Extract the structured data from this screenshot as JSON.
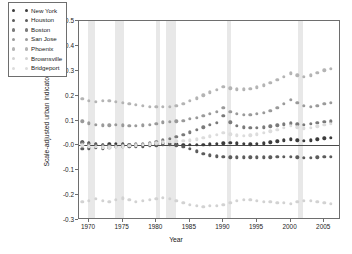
{
  "figure_tag": "FIG. 51",
  "chart_data": {
    "type": "scatter",
    "title": "",
    "xlabel": "Year",
    "ylabel": "Scale-adjusted urban indicators",
    "xlim": [
      1968.5,
      2007.5
    ],
    "ylim": [
      -0.3,
      0.5
    ],
    "xticks": [
      1970,
      1975,
      1980,
      1985,
      1990,
      1995,
      2000,
      2005
    ],
    "yticks": [
      -0.3,
      -0.2,
      -0.1,
      -0.0,
      0.1,
      0.2,
      0.3,
      0.4,
      0.5
    ],
    "ytick_labels": [
      "-0.3",
      "-0.2",
      "-0.1",
      "-0.0",
      "0.1",
      "0.2",
      "0.3",
      "0.4",
      "0.5"
    ],
    "grid": false,
    "legend_position": "upper-left",
    "zero_reference_line": 0.0,
    "shaded_bands": [
      {
        "start": 1969.9,
        "end": 1970.9
      },
      {
        "start": 1973.9,
        "end": 1975.2
      },
      {
        "start": 1980.0,
        "end": 1980.6
      },
      {
        "start": 1981.5,
        "end": 1982.9
      },
      {
        "start": 1990.5,
        "end": 1991.2
      },
      {
        "start": 2001.1,
        "end": 2001.9
      }
    ],
    "x": [
      1969,
      1970,
      1971,
      1972,
      1973,
      1974,
      1975,
      1976,
      1977,
      1978,
      1979,
      1980,
      1981,
      1982,
      1983,
      1984,
      1985,
      1986,
      1987,
      1988,
      1989,
      1990,
      1991,
      1992,
      1993,
      1994,
      1995,
      1996,
      1997,
      1998,
      1999,
      2000,
      2001,
      2002,
      2003,
      2004,
      2005,
      2006
    ],
    "series": [
      {
        "name": "New York",
        "color": "#3c3c3c",
        "values": [
          0.013,
          0.008,
          0.005,
          0.003,
          0.004,
          0.006,
          0.004,
          0.002,
          0.001,
          0.002,
          0.004,
          0.006,
          0.008,
          0.006,
          0.004,
          0.003,
          0.002,
          0.002,
          0.003,
          0.004,
          0.006,
          0.008,
          0.01,
          0.008,
          0.006,
          0.005,
          0.006,
          0.008,
          0.012,
          0.016,
          0.02,
          0.024,
          0.021,
          0.018,
          0.02,
          0.024,
          0.028,
          0.03
        ]
      },
      {
        "name": "Houston",
        "color": "#5c5c5c",
        "values": [
          -0.015,
          -0.012,
          -0.01,
          -0.012,
          -0.009,
          -0.006,
          -0.004,
          -0.004,
          -0.005,
          -0.004,
          -0.002,
          0.0,
          0.004,
          0.004,
          0.0,
          -0.006,
          -0.014,
          -0.024,
          -0.034,
          -0.04,
          -0.044,
          -0.046,
          -0.048,
          -0.048,
          -0.048,
          -0.048,
          -0.048,
          -0.048,
          -0.048,
          -0.047,
          -0.046,
          -0.046,
          -0.048,
          -0.049,
          -0.049,
          -0.048,
          -0.047,
          -0.046
        ]
      },
      {
        "name": "Boston",
        "color": "#7a7a7a",
        "values": [
          0.01,
          0.006,
          0.003,
          0.0,
          -0.002,
          -0.002,
          0.0,
          0.002,
          0.004,
          0.006,
          0.01,
          0.014,
          0.02,
          0.026,
          0.034,
          0.042,
          0.052,
          0.062,
          0.072,
          0.082,
          0.09,
          0.118,
          0.092,
          0.078,
          0.072,
          0.07,
          0.07,
          0.072,
          0.076,
          0.08,
          0.084,
          0.088,
          0.085,
          0.083,
          0.086,
          0.09,
          0.094,
          0.096
        ]
      },
      {
        "name": "San Jose",
        "color": "#9a9a9a",
        "values": [
          0.096,
          0.088,
          0.082,
          0.08,
          0.08,
          0.082,
          0.08,
          0.078,
          0.078,
          0.08,
          0.082,
          0.086,
          0.092,
          0.094,
          0.096,
          0.1,
          0.106,
          0.112,
          0.12,
          0.128,
          0.136,
          0.15,
          0.136,
          0.128,
          0.124,
          0.124,
          0.126,
          0.13,
          0.14,
          0.152,
          0.166,
          0.182,
          0.17,
          0.158,
          0.156,
          0.16,
          0.166,
          0.17
        ]
      },
      {
        "name": "Phoenix",
        "color": "#b4b4b4",
        "values": [
          0.186,
          0.18,
          0.176,
          0.178,
          0.18,
          0.176,
          0.17,
          0.166,
          0.162,
          0.158,
          0.156,
          0.154,
          0.154,
          0.156,
          0.16,
          0.168,
          0.178,
          0.19,
          0.202,
          0.214,
          0.224,
          0.236,
          0.23,
          0.226,
          0.226,
          0.228,
          0.234,
          0.242,
          0.252,
          0.264,
          0.276,
          0.29,
          0.282,
          0.276,
          0.282,
          0.292,
          0.302,
          0.308
        ]
      },
      {
        "name": "Brownsville",
        "color": "#d2d2d2",
        "values": [
          -0.228,
          -0.222,
          -0.214,
          -0.222,
          -0.226,
          -0.218,
          -0.212,
          -0.22,
          -0.226,
          -0.224,
          -0.22,
          -0.214,
          -0.21,
          -0.214,
          -0.222,
          -0.23,
          -0.238,
          -0.244,
          -0.246,
          -0.244,
          -0.242,
          -0.238,
          -0.23,
          -0.222,
          -0.218,
          -0.22,
          -0.224,
          -0.226,
          -0.228,
          -0.23,
          -0.232,
          -0.234,
          -0.228,
          -0.222,
          -0.224,
          -0.228,
          -0.232,
          -0.234
        ]
      },
      {
        "name": "Bridgeport",
        "color": "#dcdcdc",
        "values": [
          0.0,
          -0.004,
          -0.006,
          -0.008,
          -0.008,
          -0.006,
          -0.004,
          -0.002,
          0.0,
          0.002,
          0.004,
          0.008,
          0.012,
          0.014,
          0.016,
          0.018,
          0.02,
          0.024,
          0.03,
          0.036,
          0.042,
          0.05,
          0.044,
          0.04,
          0.038,
          0.04,
          0.044,
          0.05,
          0.056,
          0.062,
          0.07,
          0.078,
          0.072,
          0.068,
          0.07,
          0.076,
          0.082,
          0.086
        ]
      }
    ]
  }
}
